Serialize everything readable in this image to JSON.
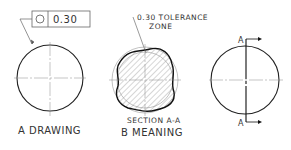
{
  "fcf": {
    "symbol": "circularity",
    "tolerance": "0.30"
  },
  "annotation": {
    "line1": "0.30 TOLERANCE",
    "line2": "ZONE"
  },
  "section_label": "SECTION A-A",
  "cut_label_top": "A",
  "cut_label_bottom": "A",
  "captions": {
    "a": "A  DRAWING",
    "b": "B  MEANING"
  }
}
